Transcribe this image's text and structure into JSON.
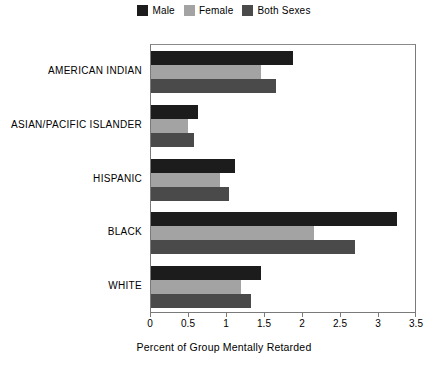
{
  "chart_data": {
    "type": "bar",
    "orientation": "horizontal",
    "title": "",
    "xlabel": "Percent of Group Mentally Retarded",
    "ylabel": "",
    "xlim": [
      0,
      3.5
    ],
    "xticks": [
      "0",
      "0.5",
      "1",
      "1.5",
      "2",
      "2.5",
      "3",
      "3.5"
    ],
    "xtick_values": [
      0,
      0.5,
      1,
      1.5,
      2,
      2.5,
      3,
      3.5
    ],
    "grid": false,
    "legend_position": "top-center",
    "categories": [
      "AMERICAN INDIAN",
      "ASIAN/PACIFIC ISLANDER",
      "HISPANIC",
      "BLACK",
      "WHITE"
    ],
    "series": [
      {
        "name": "Male",
        "color": "#1c1c1c",
        "values": [
          1.87,
          0.62,
          1.1,
          3.24,
          1.45
        ]
      },
      {
        "name": "Female",
        "color": "#a3a3a3",
        "values": [
          1.45,
          0.49,
          0.91,
          2.15,
          1.18
        ]
      },
      {
        "name": "Both Sexes",
        "color": "#4a4a4a",
        "values": [
          1.65,
          0.57,
          1.02,
          2.68,
          1.32
        ]
      }
    ]
  },
  "legend": {
    "items": [
      {
        "label": "Male",
        "color": "#1c1c1c"
      },
      {
        "label": "Female",
        "color": "#a3a3a3"
      },
      {
        "label": "Both Sexes",
        "color": "#4a4a4a"
      }
    ]
  },
  "axis": {
    "x_title": "Percent of Group Mentally Retarded"
  },
  "colors": {
    "frame": "#7a7a7a",
    "background": "#ffffff",
    "text": "#000000"
  }
}
